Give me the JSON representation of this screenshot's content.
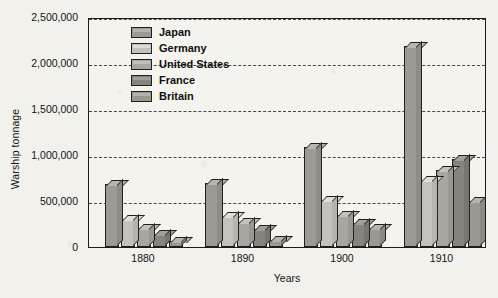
{
  "chart_data": {
    "type": "bar",
    "title": "",
    "xlabel": "Years",
    "ylabel": "Warship tonnage",
    "categories": [
      "1880",
      "1890",
      "1900",
      "1910"
    ],
    "ylim": [
      0,
      2500000
    ],
    "ytick_labels": [
      "0",
      "500,000",
      "1,000,000",
      "1,500,000",
      "2,000,000",
      "2,500,000"
    ],
    "ytick_values": [
      0,
      500000,
      1000000,
      1500000,
      2000000,
      2500000
    ],
    "grid": "horizontal-dashed",
    "legend_position": "top-center-inside",
    "series": [
      {
        "name": "Japan",
        "color": "#9c9a93",
        "values": [
          680000,
          700000,
          1090000,
          2190000
        ]
      },
      {
        "name": "Germany",
        "color": "#c4c2bb",
        "values": [
          305000,
          340000,
          510000,
          730000
        ]
      },
      {
        "name": "United States",
        "color": "#a8a69f",
        "values": [
          210000,
          270000,
          350000,
          840000
        ]
      },
      {
        "name": "France",
        "color": "#86847d",
        "values": [
          145000,
          195000,
          265000,
          960000
        ]
      },
      {
        "name": "Britain",
        "color": "#9a9891",
        "values": [
          65000,
          75000,
          205000,
          500000
        ]
      }
    ]
  },
  "axes": {
    "y_title": "Warship tonnage",
    "x_title": "Years"
  },
  "legend": {
    "items": [
      {
        "label": "Japan"
      },
      {
        "label": "Germany"
      },
      {
        "label": "United States"
      },
      {
        "label": "France"
      },
      {
        "label": "Britain"
      }
    ]
  }
}
